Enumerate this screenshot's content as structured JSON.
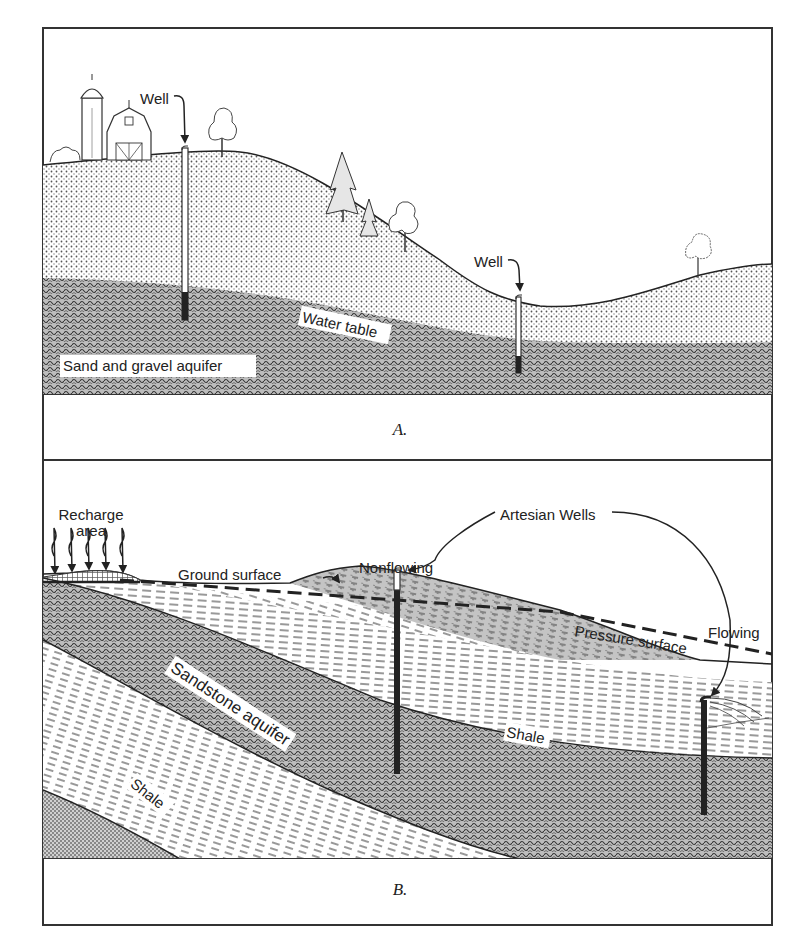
{
  "figure": {
    "panels": [
      {
        "id": "A",
        "caption": "A.",
        "labels": {
          "well_left": "Well",
          "well_right": "Well",
          "water_table": "Water table",
          "aquifer": "Sand and gravel aquifer"
        }
      },
      {
        "id": "B",
        "caption": "B.",
        "labels": {
          "recharge_line1": "Recharge",
          "recharge_line2": "area",
          "ground_surface": "Ground surface",
          "artesian_wells": "Artesian Wells",
          "nonflowing": "Nonflowing",
          "flowing": "Flowing",
          "pressure_surface": "Pressure surface",
          "sandstone_aquifer": "Sandstone aquifer",
          "shale_lower": "Shale",
          "shale_upper": "Shale"
        }
      }
    ],
    "colors": {
      "ink": "#222222",
      "paper": "#ffffff"
    }
  }
}
